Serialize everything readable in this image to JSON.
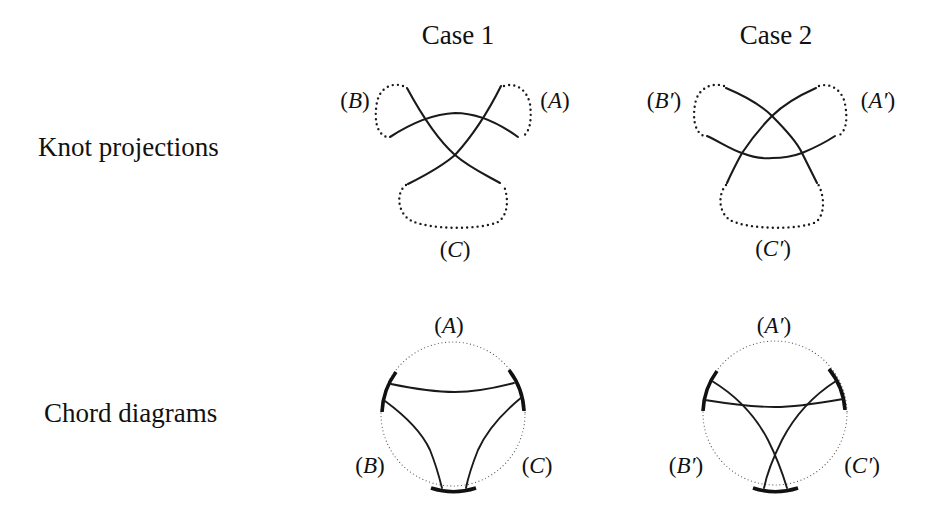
{
  "columns": [
    {
      "title": "Case 1"
    },
    {
      "title": "Case 2"
    }
  ],
  "rows": [
    {
      "label": "Knot projections"
    },
    {
      "label": "Chord diagrams"
    }
  ],
  "case1": {
    "knot_labels": {
      "A": "A",
      "B": "B",
      "C": "C"
    },
    "chord_labels": {
      "A": "A",
      "B": "B",
      "C": "C"
    }
  },
  "case2": {
    "knot_labels": {
      "A": "A′",
      "B": "B′",
      "C": "C′"
    },
    "chord_labels": {
      "A": "A′",
      "B": "B′",
      "C": "C′"
    }
  },
  "paren": {
    "open": "(",
    "close": ")"
  }
}
